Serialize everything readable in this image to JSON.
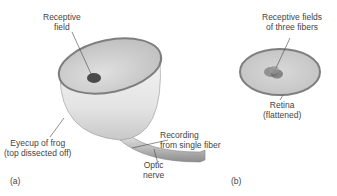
{
  "panel_a": {
    "label": "(a)",
    "receptive_field": {
      "line1": "Receptive",
      "line2": "field"
    },
    "recording": {
      "line1": "Recording",
      "line2": "from single fiber"
    },
    "eyecup": {
      "line1": "Eyecup of frog",
      "line2": "(top dissected off)"
    },
    "optic_nerve": {
      "line1": "Optic",
      "line2": "nerve"
    }
  },
  "panel_b": {
    "label": "(b)",
    "receptive_fields": {
      "line1": "Receptive fields",
      "line2": "of three fibers"
    },
    "retina": {
      "line1": "Retina",
      "line2": "(flattened)"
    }
  },
  "colors": {
    "rim": "#8a8a8a",
    "cup_inner": "#d6d6d6",
    "cup_outer": "#eeeeee",
    "spot": "#4a4a4a"
  }
}
